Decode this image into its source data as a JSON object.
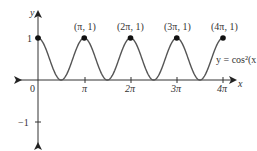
{
  "chart_data": {
    "type": "line",
    "title": "",
    "function_label": "y = cos²(x",
    "xlabel": "x",
    "ylabel": "y",
    "x_ticks": [
      "0",
      "π",
      "2π",
      "3π",
      "4π"
    ],
    "y_ticks": [
      "1",
      "−1"
    ],
    "xlim": [
      0,
      12.566
    ],
    "ylim": [
      -1,
      1
    ],
    "series": [
      {
        "name": "y = cos²x",
        "formula": "cos(x)^2"
      }
    ],
    "points": [
      {
        "label": "(0, 1)",
        "x": 0,
        "y": 1,
        "show_label": false
      },
      {
        "label": "(π, 1)",
        "x": 3.1416,
        "y": 1,
        "show_label": true
      },
      {
        "label": "(2π, 1)",
        "x": 6.2832,
        "y": 1,
        "show_label": true
      },
      {
        "label": "(3π, 1)",
        "x": 9.4248,
        "y": 1,
        "show_label": true
      },
      {
        "label": "(4π, 1)",
        "x": 12.566,
        "y": 1,
        "show_label": true
      }
    ],
    "grid": false,
    "legend": "none"
  }
}
